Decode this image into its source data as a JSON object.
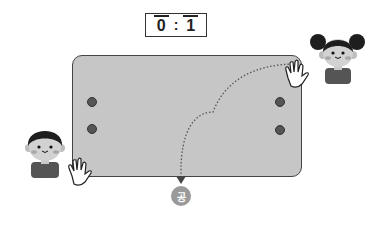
{
  "scoreboard": {
    "left_score": "0",
    "separator": ":",
    "right_score": "1"
  },
  "table": {
    "fill_color": "#c6c6c6",
    "border_color": "#444444"
  },
  "players": [
    {
      "name": "boy",
      "position": "bottom-left"
    },
    {
      "name": "girl",
      "position": "top-right"
    }
  ],
  "ball": {
    "label": "공",
    "color": "#9a9a9a"
  },
  "trajectory": {
    "style": "dotted",
    "from": "girl-hand",
    "to": "ball"
  }
}
